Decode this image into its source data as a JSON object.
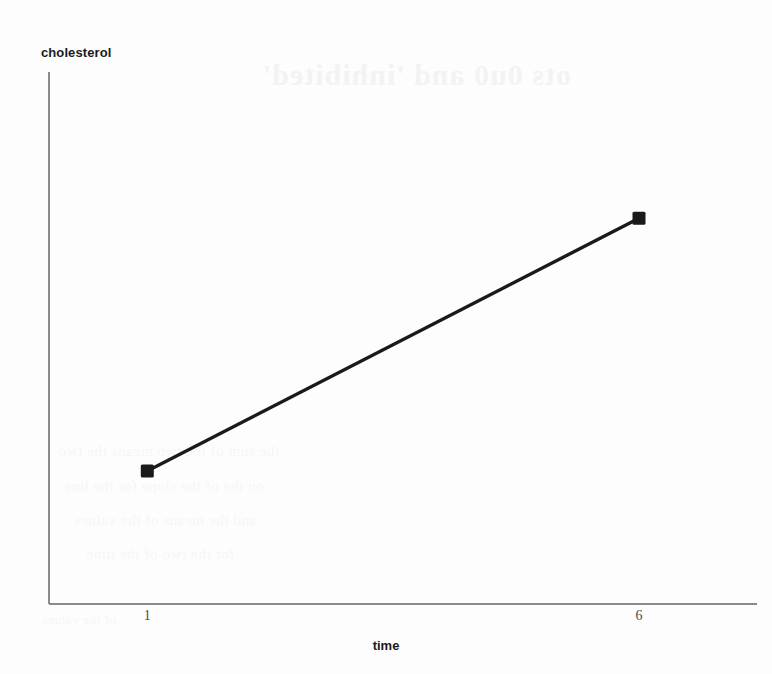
{
  "chart_data": {
    "type": "line",
    "title": "",
    "xlabel": "time",
    "ylabel": "cholesterol",
    "x": [
      1,
      6
    ],
    "values": [
      1,
      2.9
    ],
    "categories": [
      "1",
      "6"
    ],
    "xtick_labels": [
      "1",
      "6"
    ],
    "ytick_labels": [],
    "xlim": [
      0,
      7.2
    ],
    "ylim": [
      0,
      4
    ],
    "grid": false,
    "legend": null,
    "marker": "filled-square",
    "series": [
      {
        "name": "cholesterol",
        "points": [
          {
            "x": 1,
            "y": 1
          },
          {
            "x": 6,
            "y": 2.9
          }
        ]
      }
    ],
    "line_color": "#1a1a1a",
    "marker_color": "#1a1a1a",
    "axis_color": "#8a8a8a"
  },
  "axes": {
    "y_label": "cholesterol",
    "x_label": "time",
    "x_ticks": [
      {
        "label": "1"
      },
      {
        "label": "6"
      }
    ]
  },
  "artifacts": {
    "bleed_title": "ots 0u0 and 'inhibited'",
    "bleed_lines": [
      "the sum of the two means the two",
      "on the of the slope for the line",
      "and the means of the values",
      "for the two of the time",
      "of the values"
    ]
  }
}
